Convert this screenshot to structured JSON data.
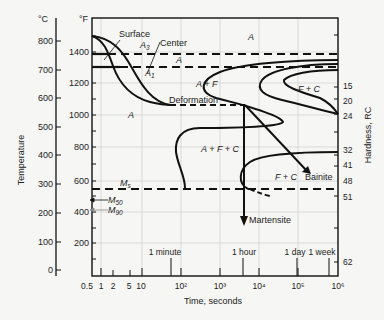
{
  "figure": {
    "type": "CCT/TTT diagram",
    "axes": {
      "left_celsius": {
        "unit_label": "°C",
        "title": "Temperature",
        "ticks": [
          800,
          700,
          600,
          500,
          400,
          300,
          200,
          100,
          0
        ]
      },
      "left_fahrenheit": {
        "unit_label": "°F",
        "ticks": [
          1400,
          1200,
          1000,
          800,
          600,
          400,
          200
        ]
      },
      "x": {
        "title": "Time, seconds",
        "scale": "log",
        "ticks": [
          "0.5",
          "1",
          "2",
          "5",
          "10",
          "10²",
          "10³",
          "10⁴",
          "10⁵",
          "10⁶"
        ],
        "time_markers": [
          "1 minute",
          "1 hour",
          "1 day",
          "1 week"
        ]
      },
      "right": {
        "title": "Hardness, RC",
        "ticks": [
          "15",
          "20",
          "24",
          "32",
          "41",
          "48",
          "51",
          "62"
        ]
      }
    },
    "lines": {
      "a3": "A3",
      "a1": "A1",
      "ms": "Ms",
      "m50": "M50",
      "m90": "M90"
    },
    "labels": {
      "surface": "Surface",
      "center": "Center",
      "deformation": "Deformation",
      "bainite": "Bainite",
      "martensite": "Martensite"
    },
    "regions": {
      "a_top": "A",
      "a_between": "A",
      "a_left": "A",
      "a_plus_f": "A + F",
      "f_plus_c_top": "F + C",
      "a_plus_f_plus_c": "A + F + C",
      "f_plus_c_bottom": "F + C"
    },
    "colors": {
      "ink": "#111111",
      "grid": "#c8c8c8",
      "background": "#f6f6f4"
    }
  }
}
